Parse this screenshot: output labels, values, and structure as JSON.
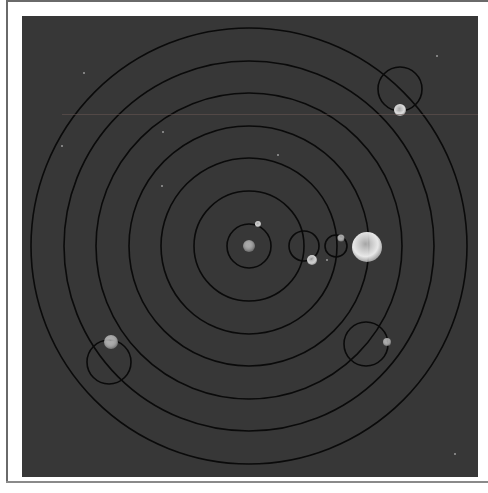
{
  "diagram": {
    "title": "",
    "type": "orrery",
    "colors": {
      "background": "#ffffff",
      "panel": "#373737",
      "orbit_line": "#0a0a0a",
      "sun": "#e6e6e6",
      "central_body": "#8a8a8a",
      "planet_light": "#d8d8d8",
      "planet_grey": "#9a9a9a"
    },
    "center": {
      "x": 227,
      "y": 230
    },
    "orbits": [
      {
        "name": "orbit-1",
        "r": 22
      },
      {
        "name": "orbit-2",
        "r": 55
      },
      {
        "name": "orbit-3",
        "r": 88
      },
      {
        "name": "orbit-4",
        "r": 120
      },
      {
        "name": "orbit-5",
        "r": 153
      },
      {
        "name": "orbit-6",
        "r": 185
      },
      {
        "name": "orbit-7",
        "r": 218
      }
    ],
    "epicycles": [
      {
        "name": "epicycle-a",
        "cx": 282,
        "cy": 230,
        "r": 15
      },
      {
        "name": "epicycle-b",
        "cx": 314,
        "cy": 230,
        "r": 11
      },
      {
        "name": "epicycle-c",
        "cx": 378,
        "cy": 73,
        "r": 22
      },
      {
        "name": "epicycle-d",
        "cx": 344,
        "cy": 328,
        "r": 22
      },
      {
        "name": "epicycle-e",
        "cx": 87,
        "cy": 346,
        "r": 22
      }
    ],
    "bodies": [
      {
        "name": "central-body",
        "cx": 227,
        "cy": 230,
        "r": 6,
        "color": "#8c8c8c"
      },
      {
        "name": "moon",
        "cx": 236,
        "cy": 208,
        "r": 3,
        "color": "#d0d0d0"
      },
      {
        "name": "planet-a",
        "cx": 290,
        "cy": 244,
        "r": 5,
        "color": "#cfcfcf"
      },
      {
        "name": "planet-b",
        "cx": 319,
        "cy": 222,
        "r": 3.5,
        "color": "#9e9e9e"
      },
      {
        "name": "sun",
        "cx": 345,
        "cy": 231,
        "r": 15,
        "color": "#e8e8e8"
      },
      {
        "name": "planet-c",
        "cx": 378,
        "cy": 94,
        "r": 6,
        "color": "#dcdcdc"
      },
      {
        "name": "planet-d",
        "cx": 365,
        "cy": 326,
        "r": 4,
        "color": "#9a9a9a"
      },
      {
        "name": "planet-e",
        "cx": 89,
        "cy": 326,
        "r": 7,
        "color": "#9c9c9c"
      }
    ],
    "stars": [
      {
        "cx": 433,
        "cy": 438
      },
      {
        "cx": 62,
        "cy": 57
      },
      {
        "cx": 141,
        "cy": 116
      },
      {
        "cx": 305,
        "cy": 244
      },
      {
        "cx": 256,
        "cy": 139
      },
      {
        "cx": 140,
        "cy": 170
      },
      {
        "cx": 40,
        "cy": 130
      },
      {
        "cx": 415,
        "cy": 40
      }
    ]
  }
}
